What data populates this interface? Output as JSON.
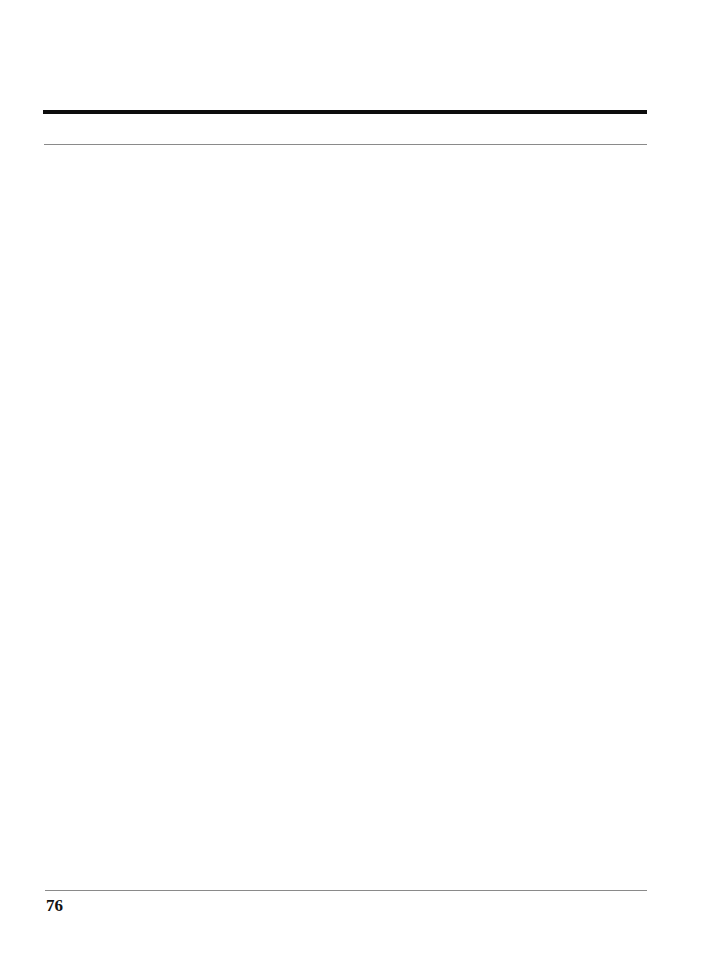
{
  "document": {
    "type": "printed-page",
    "body_content": "",
    "footer": {
      "page_number": "76"
    }
  }
}
